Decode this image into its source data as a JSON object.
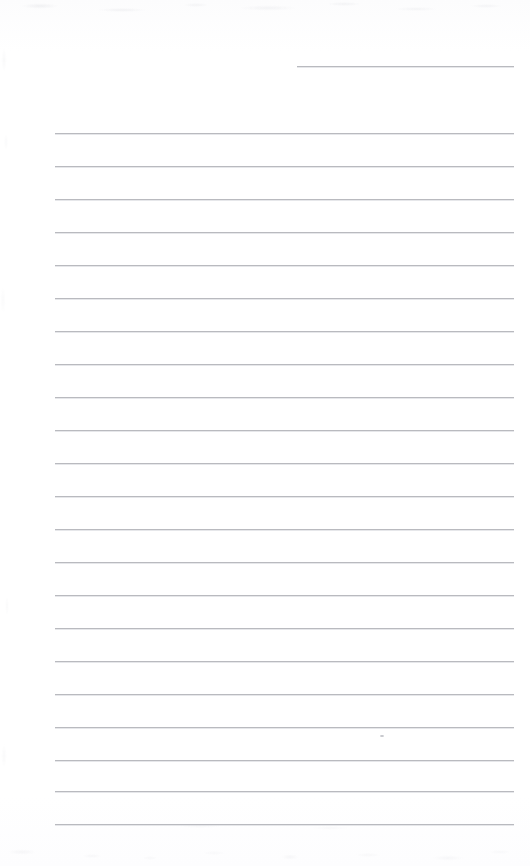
{
  "page": {
    "kind": "scanned-blank-lined-page",
    "width": 530,
    "height": 866,
    "background_color": "#fefeff",
    "rule_color": "#b9babf",
    "text_content": "",
    "caption": ""
  },
  "rules": {
    "left_margin_x": 55,
    "right_margin_x": 514,
    "line_spacing": 33,
    "first_line_y": 133,
    "count": 22,
    "lines": [
      {
        "y": 66,
        "x": 297,
        "width": 217,
        "partial": true
      },
      {
        "y": 133,
        "x": 55,
        "width": 459,
        "partial": false
      },
      {
        "y": 166,
        "x": 55,
        "width": 459,
        "partial": false
      },
      {
        "y": 199,
        "x": 55,
        "width": 459,
        "partial": false
      },
      {
        "y": 232,
        "x": 55,
        "width": 459,
        "partial": false
      },
      {
        "y": 265,
        "x": 55,
        "width": 459,
        "partial": false
      },
      {
        "y": 298,
        "x": 55,
        "width": 459,
        "partial": false
      },
      {
        "y": 331,
        "x": 55,
        "width": 459,
        "partial": false
      },
      {
        "y": 364,
        "x": 55,
        "width": 459,
        "partial": false
      },
      {
        "y": 397,
        "x": 55,
        "width": 459,
        "partial": false
      },
      {
        "y": 430,
        "x": 55,
        "width": 459,
        "partial": false
      },
      {
        "y": 463,
        "x": 55,
        "width": 459,
        "partial": false
      },
      {
        "y": 496,
        "x": 55,
        "width": 459,
        "partial": false
      },
      {
        "y": 529,
        "x": 55,
        "width": 459,
        "partial": false
      },
      {
        "y": 562,
        "x": 55,
        "width": 459,
        "partial": false
      },
      {
        "y": 595,
        "x": 55,
        "width": 459,
        "partial": false
      },
      {
        "y": 628,
        "x": 55,
        "width": 459,
        "partial": false
      },
      {
        "y": 661,
        "x": 55,
        "width": 459,
        "partial": false
      },
      {
        "y": 694,
        "x": 55,
        "width": 459,
        "partial": false
      },
      {
        "y": 727,
        "x": 55,
        "width": 459,
        "partial": false
      },
      {
        "y": 760,
        "x": 55,
        "width": 459,
        "partial": false
      },
      {
        "y": 791,
        "x": 55,
        "width": 459,
        "partial": false
      },
      {
        "y": 824,
        "x": 55,
        "width": 459,
        "partial": false
      }
    ]
  },
  "marks": [
    {
      "name": "stray-pencil-mark",
      "x": 380,
      "y": 735
    }
  ]
}
